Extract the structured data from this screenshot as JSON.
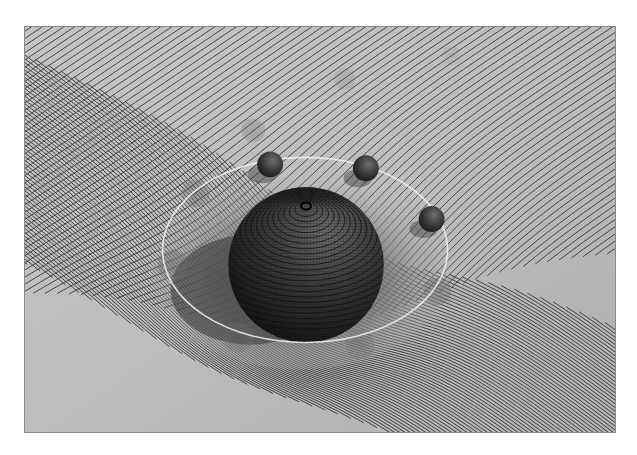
{
  "illustration": {
    "subject": "spacetime curvature around a massive body",
    "colors": {
      "surface": "#b9b9b9",
      "surface_light": "#cfcfcf",
      "grid_line": "#2e2e2e",
      "central_body": "#2a2a2a",
      "orbit_ring": "#f2f2f2",
      "satellite": "#3a3a3a",
      "frame_border": "#8a8a8a",
      "background": "#ffffff"
    },
    "central_body": {
      "label": "massive sphere",
      "cx": 306,
      "cy": 265,
      "r": 78
    },
    "orbit": {
      "label": "orbit ring",
      "cx": 305,
      "cy": 250,
      "rx": 143,
      "ry": 93
    },
    "satellites": [
      {
        "label": "satellite 1",
        "cx": 270,
        "cy": 164,
        "r": 13,
        "opacity": 1
      },
      {
        "label": "satellite 2",
        "cx": 366,
        "cy": 168,
        "r": 13,
        "opacity": 1
      },
      {
        "label": "satellite 3",
        "cx": 432,
        "cy": 219,
        "r": 13,
        "opacity": 1
      }
    ],
    "ghost_spheres": [
      {
        "label": "trail 1",
        "cx": 195,
        "cy": 193,
        "r": 14,
        "opacity": 0.35
      },
      {
        "label": "trail 2",
        "cx": 172,
        "cy": 265,
        "r": 15,
        "opacity": 0.35
      },
      {
        "label": "trail 3",
        "cx": 238,
        "cy": 338,
        "r": 15,
        "opacity": 0.3
      },
      {
        "label": "trail 4",
        "cx": 360,
        "cy": 345,
        "r": 15,
        "opacity": 0.3
      },
      {
        "label": "trail 5",
        "cx": 438,
        "cy": 292,
        "r": 14,
        "opacity": 0.35
      },
      {
        "label": "trail 6",
        "cx": 253,
        "cy": 130,
        "r": 12,
        "opacity": 0.25
      },
      {
        "label": "trail 7",
        "cx": 345,
        "cy": 78,
        "r": 11,
        "opacity": 0.15
      },
      {
        "label": "trail 8",
        "cx": 452,
        "cy": 55,
        "r": 10,
        "opacity": 0.1
      }
    ]
  },
  "caption": {
    "text": ""
  }
}
